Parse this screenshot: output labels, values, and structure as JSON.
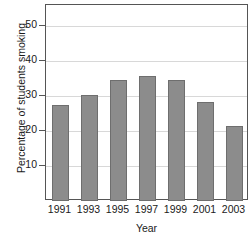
{
  "chart_data": {
    "type": "bar",
    "title": "",
    "xlabel": "Year",
    "ylabel": "Percentage of students smoking",
    "categories": [
      "1991",
      "1993",
      "1995",
      "1997",
      "1999",
      "2001",
      "2003"
    ],
    "values": [
      27.5,
      30.3,
      34.5,
      35.7,
      34.5,
      28.3,
      21.5
    ],
    "ylim": [
      0,
      56
    ],
    "yticks": [
      10,
      20,
      30,
      40,
      50
    ],
    "ytick_labels": [
      "10",
      "20",
      "30",
      "40",
      "50"
    ],
    "grid": true,
    "legend": false,
    "bar_color": "#8c8c8c",
    "bar_edge_color": "#6e6e6e",
    "gridline_color": "#d8d8d8",
    "axis_color": "#555555",
    "background_color": "#ffffff"
  }
}
